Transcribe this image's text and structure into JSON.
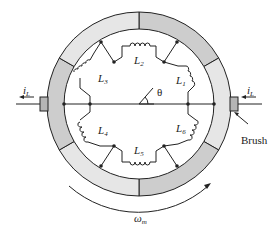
{
  "diagram": {
    "type": "dc-machine-commutator-ring",
    "inductors": [
      {
        "label": "L",
        "sub": "1"
      },
      {
        "label": "L",
        "sub": "2"
      },
      {
        "label": "L",
        "sub": "3"
      },
      {
        "label": "L",
        "sub": "4"
      },
      {
        "label": "L",
        "sub": "5"
      },
      {
        "label": "L",
        "sub": "6"
      }
    ],
    "angle_label": "θ",
    "current_left": {
      "label": "i",
      "sub": "L"
    },
    "current_right": {
      "label": "i",
      "sub": "L"
    },
    "brush_label": "Brush",
    "speed_label": {
      "label": "ω",
      "sub": "m"
    },
    "colors": {
      "segment_light": "#e4e4e4",
      "segment_dark": "#c8c8c8",
      "brush": "#b5b5b5",
      "line": "#222222"
    }
  }
}
